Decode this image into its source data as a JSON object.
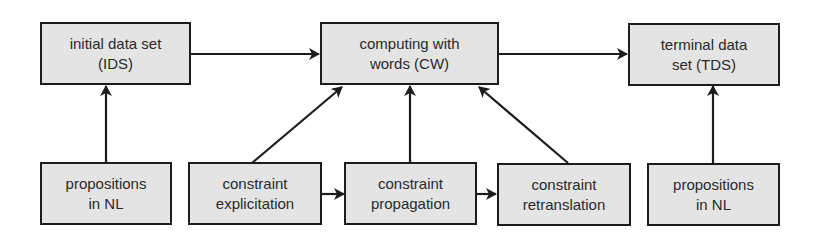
{
  "diagram": {
    "nodes": [
      {
        "id": "ids",
        "lines": [
          "initial data set",
          "(IDS)"
        ]
      },
      {
        "id": "cw",
        "lines": [
          "computing with",
          "words (CW)"
        ]
      },
      {
        "id": "tds",
        "lines": [
          "terminal data",
          "set (TDS)"
        ]
      },
      {
        "id": "nl1",
        "lines": [
          "propositions",
          "in NL"
        ]
      },
      {
        "id": "explicitation",
        "lines": [
          "constraint",
          "explicitation"
        ]
      },
      {
        "id": "propagation",
        "lines": [
          "constraint",
          "propagation"
        ]
      },
      {
        "id": "retranslation",
        "lines": [
          "constraint",
          "retranslation"
        ]
      },
      {
        "id": "nl2",
        "lines": [
          "propositions",
          "in NL"
        ]
      }
    ],
    "edges": [
      {
        "from": "ids",
        "to": "cw"
      },
      {
        "from": "cw",
        "to": "tds"
      },
      {
        "from": "nl1",
        "to": "ids"
      },
      {
        "from": "explicitation",
        "to": "cw"
      },
      {
        "from": "propagation",
        "to": "cw"
      },
      {
        "from": "retranslation",
        "to": "cw"
      },
      {
        "from": "nl2",
        "to": "tds"
      },
      {
        "from": "explicitation",
        "to": "propagation"
      },
      {
        "from": "propagation",
        "to": "retranslation"
      }
    ],
    "colors": {
      "box_fill": "#e4e4e4",
      "stroke": "#1c1c1c",
      "text": "#2a2a2a"
    }
  }
}
